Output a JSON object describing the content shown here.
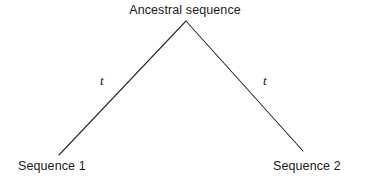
{
  "figure": {
    "type": "phylogenetic-tree-diagram",
    "background_color": "#ffffff",
    "line_color": "#2b2b2b",
    "text_color": "#1a1a1a"
  },
  "nodes": {
    "ancestral": {
      "label": "Ancestral sequence",
      "x": 186,
      "y": 21
    },
    "leaf_left": {
      "label": "Sequence 1",
      "x": 59,
      "y": 155
    },
    "leaf_right": {
      "label": "Sequence 2",
      "x": 303,
      "y": 151
    }
  },
  "branches": [
    {
      "name": "left-branch",
      "from": "ancestral",
      "to": "leaf_left",
      "length_label": "t",
      "x1": 186,
      "y1": 21,
      "x2": 59,
      "y2": 155
    },
    {
      "name": "right-branch",
      "from": "ancestral",
      "to": "leaf_right",
      "length_label": "t",
      "x1": 186,
      "y1": 21,
      "x2": 303,
      "y2": 151
    }
  ]
}
